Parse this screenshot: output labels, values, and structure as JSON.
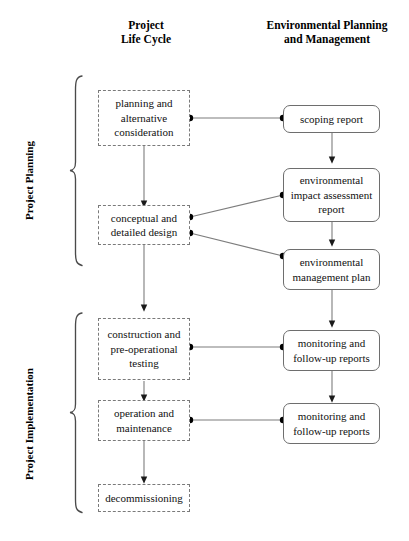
{
  "diagram": {
    "title_hidden": "",
    "columns": [
      {
        "id": "life-cycle",
        "label": "Project\nLife Cycle"
      },
      {
        "id": "env-planning",
        "label": "Environmental Planning\nand Management"
      }
    ],
    "column_labels": {
      "left_line1": "Project",
      "left_line2": "Life Cycle",
      "right_line1": "Environmental Planning",
      "right_line2": "and Management"
    },
    "phases": [
      {
        "id": "project-planning",
        "label": "Project Planning"
      },
      {
        "id": "project-implementation",
        "label": "Project Implementation"
      }
    ],
    "nodes": {
      "planning_alternative": {
        "label": "planning and\nalternative\nconsideration",
        "style": "dashed",
        "column": "life-cycle"
      },
      "conceptual_design": {
        "label": "conceptual and\ndetailed design",
        "style": "dashed",
        "column": "life-cycle"
      },
      "construction_testing": {
        "label": "construction and\npre-operational\ntesting",
        "style": "dashed",
        "column": "life-cycle"
      },
      "operation_maintenance": {
        "label": "operation and\nmaintenance",
        "style": "dashed",
        "column": "life-cycle"
      },
      "decommissioning": {
        "label": "decommissioning",
        "style": "dashed",
        "column": "life-cycle"
      },
      "scoping_report": {
        "label": "scoping report",
        "style": "solid",
        "column": "env-planning"
      },
      "eia_report": {
        "label": "environmental\nimpact assessment\nreport",
        "style": "solid",
        "column": "env-planning"
      },
      "emp": {
        "label": "environmental\nmanagement plan",
        "style": "solid",
        "column": "env-planning"
      },
      "monitoring_1": {
        "label": "monitoring and\nfollow-up reports",
        "style": "solid",
        "column": "env-planning"
      },
      "monitoring_2": {
        "label": "monitoring and\nfollow-up reports",
        "style": "solid",
        "column": "env-planning"
      }
    },
    "connections": [
      {
        "from": "planning_alternative",
        "to": "scoping_report",
        "kind": "link-dotted-ends"
      },
      {
        "from": "conceptual_design",
        "to": "eia_report",
        "kind": "link-dotted-ends"
      },
      {
        "from": "conceptual_design",
        "to": "emp",
        "kind": "link-dotted-ends"
      },
      {
        "from": "construction_testing",
        "to": "monitoring_1",
        "kind": "link-dotted-ends"
      },
      {
        "from": "operation_maintenance",
        "to": "monitoring_2",
        "kind": "link-dotted-ends"
      },
      {
        "from": "planning_alternative",
        "to": "conceptual_design",
        "kind": "arrow-down"
      },
      {
        "from": "conceptual_design",
        "to": "construction_testing",
        "kind": "arrow-down"
      },
      {
        "from": "construction_testing",
        "to": "operation_maintenance",
        "kind": "arrow-down"
      },
      {
        "from": "operation_maintenance",
        "to": "decommissioning",
        "kind": "arrow-down"
      },
      {
        "from": "scoping_report",
        "to": "eia_report",
        "kind": "arrow-down"
      },
      {
        "from": "eia_report",
        "to": "emp",
        "kind": "arrow-down"
      },
      {
        "from": "emp",
        "to": "monitoring_1",
        "kind": "arrow-down"
      },
      {
        "from": "monitoring_1",
        "to": "monitoring_2",
        "kind": "arrow-down"
      }
    ],
    "colors": {
      "line": "#6e6e6e",
      "dashed_border": "#7a7a7a",
      "solid_border": "#6e6e6e",
      "text": "#111111",
      "background": "#ffffff",
      "dot": "#000000"
    }
  }
}
